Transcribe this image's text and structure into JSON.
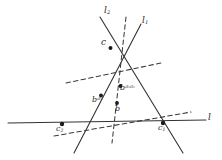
{
  "figure": {
    "kind": "geometric-diagram",
    "background_color": "#ffffff",
    "ink_color": "#2b2b2b",
    "solid_line_color": "#333333",
    "dashed_line_color": "#3a3a3a",
    "point_color": "#1a1a1a"
  },
  "labels": {
    "line_l": "l",
    "line_l1_base": "l",
    "line_l1_sub": "1",
    "line_l2_base": "l",
    "line_l2_sub": "2",
    "vertex_c": "c",
    "vertex_c1_base": "c",
    "vertex_c1_sub": "1",
    "vertex_c2_base": "c",
    "vertex_c2_sub": "2",
    "point_b": "b",
    "point_b_sigma1_base": "b",
    "point_b_sigma1_sup": "σ",
    "point_b_sigma1_sup_sub": "1",
    "point_b_sigma1sigma2_base": "b",
    "point_b_sigma1sigma2_sup1": "σ",
    "point_b_sigma1sigma2_sup1_sub": "1",
    "point_b_sigma1sigma2_sup2": "σ",
    "point_b_sigma1sigma2_sup2_sub": "2"
  },
  "geometry": {
    "vertices": {
      "c": {
        "x": 110,
        "y": 48
      },
      "c1": {
        "x": 163,
        "y": 124
      },
      "c2": {
        "x": 62,
        "y": 124
      }
    },
    "points": {
      "b": {
        "x": 117,
        "y": 104
      },
      "b_sigma1": {
        "x": 100,
        "y": 96
      },
      "b_sigma1sig2": {
        "x": 120,
        "y": 86
      }
    },
    "solid_segments": [
      {
        "name": "line-l-horizontal",
        "x1": 8,
        "y1": 123,
        "x2": 206,
        "y2": 120
      },
      {
        "name": "line-l1",
        "x1": 140,
        "y1": 24,
        "x2": 75,
        "y2": 152
      },
      {
        "name": "line-l2",
        "x1": 100,
        "y1": 18,
        "x2": 182,
        "y2": 152
      }
    ],
    "dashed_segments": [
      {
        "name": "dashed-vertical-through-b",
        "x1": 125,
        "y1": 18,
        "x2": 113,
        "y2": 142
      },
      {
        "name": "dashed-from-c2-right",
        "x1": 55,
        "y1": 135,
        "x2": 190,
        "y2": 113
      },
      {
        "name": "dashed-upper-right",
        "x1": 68,
        "y1": 82,
        "x2": 160,
        "y2": 64
      }
    ]
  }
}
